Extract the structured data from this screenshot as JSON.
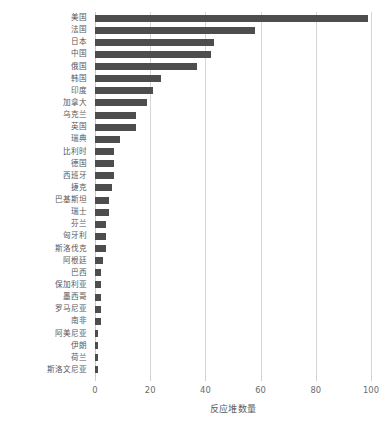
{
  "chart_data": {
    "type": "bar",
    "orientation": "horizontal",
    "title": "",
    "xlabel": "反应堆数量",
    "ylabel": "",
    "xlim": [
      0,
      100
    ],
    "xticks": [
      0,
      20,
      40,
      60,
      80,
      100
    ],
    "xtick_labels": [
      "0",
      "20",
      "40",
      "60",
      "80",
      "100"
    ],
    "grid": true,
    "grid_axis": "x",
    "legend": false,
    "bar_color": "#4d4d4d",
    "grid_color": "#d6d6d6",
    "categories": [
      "美国",
      "法国",
      "日本",
      "中国",
      "俄国",
      "韩国",
      "印度",
      "加拿大",
      "乌克兰",
      "英国",
      "瑞典",
      "比利时",
      "德国",
      "西班牙",
      "捷克",
      "巴基斯坦",
      "瑞士",
      "芬兰",
      "匈牙利",
      "斯洛伐克",
      "阿根廷",
      "巴西",
      "保加利亚",
      "墨西哥",
      "罗马尼亚",
      "南非",
      "阿美尼亚",
      "伊朗",
      "荷兰",
      "斯洛文尼亚"
    ],
    "values": [
      99,
      58,
      43,
      42,
      37,
      24,
      21,
      19,
      15,
      15,
      9,
      7,
      7,
      7,
      6,
      5,
      5,
      4,
      4,
      4,
      3,
      2,
      2,
      2,
      2,
      2,
      1,
      1,
      1,
      1
    ]
  }
}
